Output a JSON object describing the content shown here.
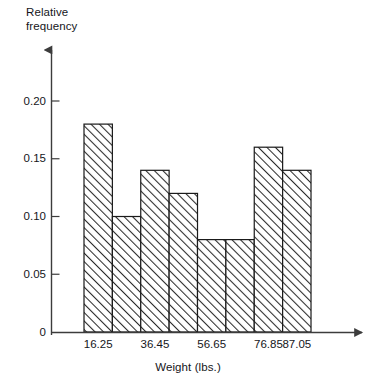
{
  "chart_data": {
    "type": "bar",
    "title": "",
    "subtitle": "",
    "xlabel": "Weight (lbs.)",
    "ylabel": "Relative\nfrequency",
    "ylabel_line1": "Relative",
    "ylabel_line2": "frequency",
    "categories": [
      "16.25-26.35",
      "26.35-36.45",
      "36.45-46.55",
      "46.55-56.65",
      "56.65-66.75",
      "66.75-76.85",
      "76.85-86.95",
      "86.95-97.05"
    ],
    "values": [
      0.18,
      0.1,
      0.14,
      0.12,
      0.08,
      0.08,
      0.16,
      0.14
    ],
    "bin_edges": [
      16.25,
      26.35,
      36.45,
      46.55,
      56.65,
      66.75,
      76.85,
      86.95,
      97.05
    ],
    "x_tick_labels": [
      "16.25",
      "36.45",
      "56.65",
      "76.85",
      "87.05"
    ],
    "x_tick_bin_index": [
      0,
      2,
      4,
      6,
      7
    ],
    "y_tick_labels": [
      "0",
      "0.05",
      "0.10",
      "0.15",
      "0.20"
    ],
    "y_tick_values": [
      0,
      0.05,
      0.1,
      0.15,
      0.2
    ],
    "ylim": [
      0,
      0.2308
    ],
    "grid": false,
    "legend": "none",
    "bar_fill": "hatched-diagonal",
    "bar_edge_color": "#1a1a1a",
    "axis_color": "#3c3c3c",
    "text_color": "#15161a"
  }
}
